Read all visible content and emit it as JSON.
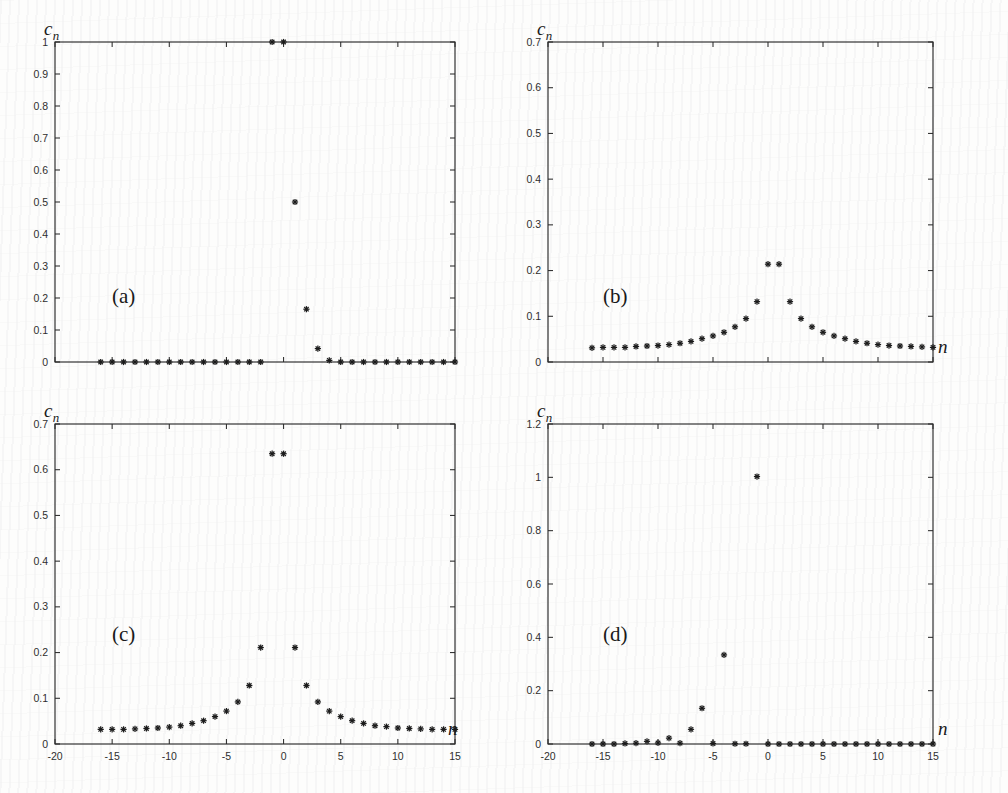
{
  "figure": {
    "ylabel": "c",
    "ylabel_sub": "n",
    "xlabel": "n"
  },
  "panels": [
    {
      "tag": "(a)",
      "name": "panel-a",
      "ylabel": "c",
      "ylabel_sub": "n",
      "xlabel": "",
      "show_xticklabels": false,
      "ytick_labels": [
        "0",
        "0.1",
        "0.2",
        "0.3",
        "0.4",
        "0.5",
        "0.6",
        "0.7",
        "0.8",
        "0.9",
        "1"
      ],
      "xtick_labels": [
        "-20",
        "-15",
        "-10",
        "-5",
        "0",
        "5",
        "10",
        "15"
      ]
    },
    {
      "tag": "(b)",
      "name": "panel-b",
      "ylabel": "c",
      "ylabel_sub": "n",
      "xlabel": "n",
      "show_xticklabels": false,
      "ytick_labels": [
        "0",
        "0.1",
        "0.2",
        "0.3",
        "0.4",
        "0.5",
        "0.6",
        "0.7"
      ],
      "xtick_labels": [
        "-20",
        "-15",
        "-10",
        "-5",
        "0",
        "5",
        "10",
        "15"
      ]
    },
    {
      "tag": "(c)",
      "name": "panel-c",
      "ylabel": "c",
      "ylabel_sub": "n",
      "xlabel": "n",
      "show_xticklabels": true,
      "ytick_labels": [
        "0",
        "0.1",
        "0.2",
        "0.3",
        "0.4",
        "0.5",
        "0.6",
        "0.7"
      ],
      "xtick_labels": [
        "-20",
        "-15",
        "-10",
        "-5",
        "0",
        "5",
        "10",
        "15"
      ]
    },
    {
      "tag": "(d)",
      "name": "panel-d",
      "ylabel": "c",
      "ylabel_sub": "n",
      "xlabel": "n",
      "show_xticklabels": true,
      "ytick_labels": [
        "0",
        "0.2",
        "0.4",
        "0.6",
        "0.8",
        "1",
        "1.2"
      ],
      "xtick_labels": [
        "-20",
        "-15",
        "-10",
        "-5",
        "0",
        "5",
        "10",
        "15"
      ]
    }
  ],
  "chart_data": [
    {
      "type": "scatter",
      "panel": "(a)",
      "title": "",
      "xlabel": "n",
      "ylabel": "c_n",
      "xlim": [
        -20,
        15
      ],
      "ylim": [
        0,
        1
      ],
      "xticks": [
        -20,
        -15,
        -10,
        -5,
        0,
        5,
        10,
        15
      ],
      "yticks": [
        0,
        0.1,
        0.2,
        0.3,
        0.4,
        0.5,
        0.6,
        0.7,
        0.8,
        0.9,
        1
      ],
      "grid": false,
      "legend": null,
      "marker": "asterisk",
      "x": [
        -16,
        -15,
        -14,
        -13,
        -12,
        -11,
        -10,
        -9,
        -8,
        -7,
        -6,
        -5,
        -4,
        -3,
        -2,
        -1,
        0,
        1,
        2,
        3,
        4,
        5,
        6,
        7,
        8,
        9,
        10,
        11,
        12,
        13,
        14,
        15
      ],
      "y": [
        0,
        0,
        0,
        0,
        0,
        0,
        0,
        0,
        0,
        0,
        0,
        0,
        0,
        0,
        0,
        1.0,
        1.0,
        0.5,
        0.165,
        0.042,
        0.005,
        0,
        0,
        0,
        0,
        0,
        0,
        0,
        0,
        0,
        0,
        0
      ]
    },
    {
      "type": "scatter",
      "panel": "(b)",
      "title": "",
      "xlabel": "n",
      "ylabel": "c_n",
      "xlim": [
        -20,
        15
      ],
      "ylim": [
        0,
        0.7
      ],
      "xticks": [
        -20,
        -15,
        -10,
        -5,
        0,
        5,
        10,
        15
      ],
      "yticks": [
        0,
        0.1,
        0.2,
        0.3,
        0.4,
        0.5,
        0.6,
        0.7
      ],
      "grid": false,
      "legend": null,
      "marker": "asterisk",
      "x": [
        -16,
        -15,
        -14,
        -13,
        -12,
        -11,
        -10,
        -9,
        -8,
        -7,
        -6,
        -5,
        -4,
        -3,
        -2,
        -1,
        0,
        1,
        2,
        3,
        4,
        5,
        6,
        7,
        8,
        9,
        10,
        11,
        12,
        13,
        14,
        15
      ],
      "y": [
        0.031,
        0.032,
        0.032,
        0.032,
        0.034,
        0.035,
        0.036,
        0.038,
        0.041,
        0.045,
        0.051,
        0.057,
        0.065,
        0.077,
        0.095,
        0.132,
        0.214,
        0.214,
        0.132,
        0.095,
        0.077,
        0.065,
        0.057,
        0.051,
        0.045,
        0.041,
        0.038,
        0.036,
        0.035,
        0.034,
        0.033,
        0.032
      ]
    },
    {
      "type": "scatter",
      "panel": "(c)",
      "title": "",
      "xlabel": "n",
      "ylabel": "c_n",
      "xlim": [
        -20,
        15
      ],
      "ylim": [
        0,
        0.7
      ],
      "xticks": [
        -20,
        -15,
        -10,
        -5,
        0,
        5,
        10,
        15
      ],
      "yticks": [
        0,
        0.1,
        0.2,
        0.3,
        0.4,
        0.5,
        0.6,
        0.7
      ],
      "grid": false,
      "legend": null,
      "marker": "asterisk",
      "x": [
        -16,
        -15,
        -14,
        -13,
        -12,
        -11,
        -10,
        -9,
        -8,
        -7,
        -6,
        -5,
        -4,
        -3,
        -2,
        -1,
        0,
        1,
        2,
        3,
        4,
        5,
        6,
        7,
        8,
        9,
        10,
        11,
        12,
        13,
        14,
        15
      ],
      "y": [
        0.032,
        0.032,
        0.032,
        0.033,
        0.034,
        0.035,
        0.037,
        0.04,
        0.045,
        0.051,
        0.06,
        0.072,
        0.092,
        0.128,
        0.211,
        0.635,
        0.635,
        0.211,
        0.128,
        0.092,
        0.072,
        0.06,
        0.051,
        0.045,
        0.04,
        0.038,
        0.035,
        0.034,
        0.033,
        0.032,
        0.032,
        0.032
      ]
    },
    {
      "type": "scatter",
      "panel": "(d)",
      "title": "",
      "xlabel": "n",
      "ylabel": "c_n",
      "xlim": [
        -20,
        15
      ],
      "ylim": [
        0,
        1.2
      ],
      "xticks": [
        -20,
        -15,
        -10,
        -5,
        0,
        5,
        10,
        15
      ],
      "yticks": [
        0,
        0.2,
        0.4,
        0.6,
        0.8,
        1,
        1.2
      ],
      "grid": false,
      "legend": null,
      "marker": "asterisk",
      "x": [
        -16,
        -15,
        -14,
        -13,
        -12,
        -11,
        -10,
        -9,
        -8,
        -7,
        -6,
        -5,
        -4,
        -3,
        -2,
        -1,
        0,
        1,
        2,
        3,
        4,
        5,
        6,
        7,
        8,
        9,
        10,
        11,
        12,
        13,
        14,
        15
      ],
      "y": [
        0,
        0,
        0,
        0.002,
        0.003,
        0.01,
        0.004,
        0.022,
        0.003,
        0.055,
        0.134,
        0.002,
        0.334,
        0.001,
        0.001,
        1.003,
        0,
        0,
        0,
        0,
        0,
        0,
        0,
        0,
        0,
        0,
        0,
        0,
        0,
        0,
        0,
        0
      ]
    }
  ]
}
